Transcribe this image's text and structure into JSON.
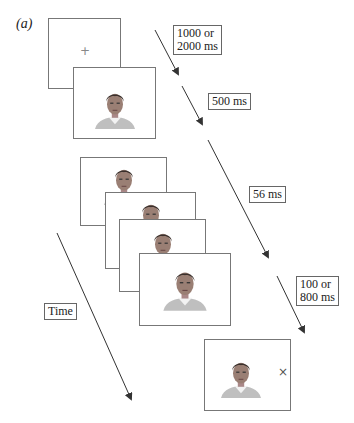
{
  "figure": {
    "panel_label": "(a)",
    "fixation_symbol": "+",
    "probe_symbol": "×",
    "durations": {
      "fixation": "1000 or\n2000 ms",
      "face": "500 ms",
      "sequence": "56 ms",
      "probe": "100 or\n800 ms"
    },
    "duration_lines": {
      "fixation": [
        "1000 or",
        "2000 ms"
      ],
      "face": [
        "500 ms"
      ],
      "sequence": [
        "56 ms"
      ],
      "probe": [
        "100 or",
        "800 ms"
      ]
    },
    "time_label": "Time",
    "frames": [
      {
        "id": "fixation-frame",
        "content": "fixation cross"
      },
      {
        "id": "face-frame",
        "content": "face"
      },
      {
        "id": "sequence-frame-1",
        "content": "face"
      },
      {
        "id": "sequence-frame-2",
        "content": "face"
      },
      {
        "id": "sequence-frame-3",
        "content": "face"
      },
      {
        "id": "sequence-frame-4",
        "content": "face"
      },
      {
        "id": "probe-frame",
        "content": "face with × probe"
      }
    ],
    "colors": {
      "frame_border": "#777777",
      "arrow": "#333333",
      "background": "#ffffff"
    }
  }
}
